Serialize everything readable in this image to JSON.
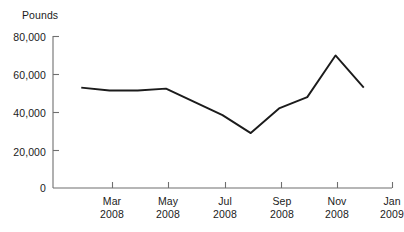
{
  "chart_data": {
    "type": "line",
    "title": "",
    "ylabel": "Pounds",
    "xlabel": "",
    "ylim": [
      0,
      80000
    ],
    "yticks": [
      0,
      20000,
      40000,
      60000,
      80000
    ],
    "ytick_labels": [
      "0",
      "20,000",
      "40,000",
      "60,000",
      "80,000"
    ],
    "xtick_labels": [
      {
        "month": "Mar",
        "year": "2008"
      },
      {
        "month": "May",
        "year": "2008"
      },
      {
        "month": "Jul",
        "year": "2008"
      },
      {
        "month": "Sep",
        "year": "2008"
      },
      {
        "month": "Nov",
        "year": "2008"
      },
      {
        "month": "Jan",
        "year": "2009"
      }
    ],
    "grid": false,
    "legend": false,
    "line_color": "#1b1b1b",
    "axis_color": "#6f6f6f",
    "x": [
      "Feb 2008",
      "Mar 2008",
      "Apr 2008",
      "May 2008",
      "Jun 2008",
      "Jul 2008",
      "Aug 2008",
      "Sep 2008",
      "Oct 2008",
      "Nov 2008",
      "Dec 2008"
    ],
    "values": [
      53000,
      51500,
      51500,
      52500,
      45500,
      38500,
      29000,
      42000,
      48000,
      70000,
      53000
    ],
    "series": [
      {
        "name": "Pounds",
        "values": [
          53000,
          51500,
          51500,
          52500,
          45500,
          38500,
          29000,
          42000,
          48000,
          70000,
          53000
        ]
      }
    ]
  }
}
